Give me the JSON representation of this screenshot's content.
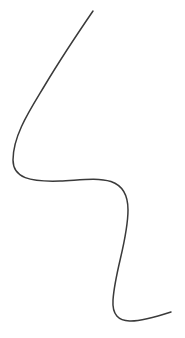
{
  "canvas": {
    "width": 185,
    "height": 338,
    "background": "#ffffff"
  },
  "top_fragment": {
    "text": "",
    "color": "#b8b8b8"
  },
  "curve": {
    "name": "freehand-line",
    "stroke_color": "#3a3a3a",
    "stroke_width": 1.5,
    "path": "M 93 11 C 80 30, 60 60, 45 85 C 30 110, 13 135, 13 160 C 13 178, 30 182, 60 181 C 90 180, 128 170, 128 210 C 128 240, 115 270, 113 300 C 111 330, 140 322, 171 312"
  }
}
